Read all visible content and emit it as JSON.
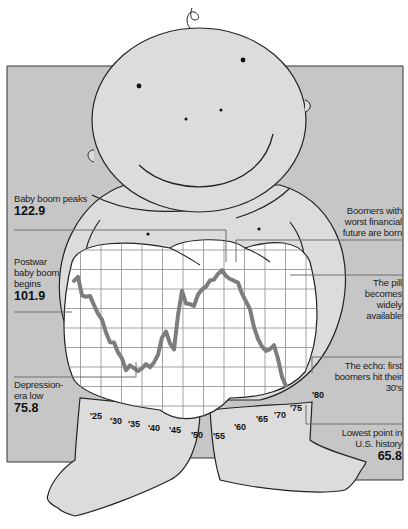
{
  "colors": {
    "panel": "#c6c6c6",
    "baby_fill": "#dcdcdc",
    "outline": "#222222",
    "grid": "#8a8a8a",
    "series": "#7d7d7d",
    "leader": "#6e6e6e",
    "chart_bg": "#ffffff"
  },
  "annotations": {
    "peak": {
      "text": "Baby boom peaks",
      "value": "122.9"
    },
    "postwar": {
      "text": "Postwar baby boom begins",
      "value": "101.9"
    },
    "depression": {
      "text": "Depression-era low",
      "value": "75.8"
    },
    "boomers_worst": {
      "text": "Boomers with worst financial future are born"
    },
    "pill": {
      "text": "The pill becomes widely available"
    },
    "echo": {
      "text": "The echo: first boomers hit their 30's"
    },
    "lowest": {
      "text": "Lowest point in U.S. history",
      "value": "65.8"
    }
  },
  "ticks": [
    "'25",
    "'30",
    "'35",
    "'40",
    "'45",
    "'50",
    "'55",
    "'60",
    "'65",
    "'70",
    "'75",
    "'80"
  ],
  "chart_data": {
    "type": "line",
    "title": "",
    "xlabel": "",
    "ylabel": "",
    "grid": true,
    "xlim": [
      1920,
      1982
    ],
    "ylim": [
      60,
      130
    ],
    "x": [
      1920,
      1921,
      1922,
      1923,
      1924,
      1925,
      1926,
      1927,
      1928,
      1929,
      1930,
      1931,
      1932,
      1933,
      1934,
      1935,
      1936,
      1937,
      1938,
      1939,
      1940,
      1941,
      1942,
      1943,
      1944,
      1945,
      1946,
      1947,
      1948,
      1949,
      1950,
      1951,
      1952,
      1953,
      1954,
      1955,
      1956,
      1957,
      1958,
      1959,
      1960,
      1961,
      1962,
      1963,
      1964,
      1965,
      1966,
      1967,
      1968,
      1969,
      1970,
      1971,
      1972,
      1973,
      1974,
      1975,
      1976,
      1977,
      1978,
      1979,
      1980
    ],
    "series": [
      {
        "name": "U.S. fertility rate (births per 1,000 women 15-44)",
        "values": [
          117.9,
          119.8,
          111.2,
          110.5,
          110.9,
          106.6,
          102.6,
          99.8,
          93.8,
          89.3,
          89.2,
          84.6,
          81.7,
          76.3,
          78.5,
          77.2,
          75.8,
          77.1,
          79.1,
          77.6,
          79.9,
          83.4,
          91.5,
          94.3,
          88.8,
          85.9,
          101.9,
          113.3,
          107.3,
          107.1,
          106.2,
          111.5,
          113.9,
          115.2,
          118.1,
          118.5,
          121.2,
          122.9,
          120.2,
          118.8,
          118.0,
          117.1,
          112.0,
          108.3,
          104.7,
          96.3,
          90.8,
          87.2,
          85.2,
          86.1,
          87.9,
          81.6,
          73.1,
          68.8,
          67.8,
          66.0,
          65.8,
          67.8,
          66.6,
          68.5,
          68.4
        ]
      }
    ],
    "annotations": [
      {
        "x": 1936,
        "y": 75.8,
        "text": "Depression-era low"
      },
      {
        "x": 1946,
        "y": 101.9,
        "text": "Postwar baby boom begins"
      },
      {
        "x": 1957,
        "y": 122.9,
        "text": "Baby boom peaks"
      },
      {
        "x": 1958,
        "text": "Boomers with worst financial future are born"
      },
      {
        "x": 1963,
        "text": "The pill becomes widely available"
      },
      {
        "x": 1976,
        "y": 65.8,
        "text": "Lowest point in U.S. history"
      },
      {
        "x": 1978,
        "text": "The echo: first boomers hit their 30's"
      }
    ]
  }
}
